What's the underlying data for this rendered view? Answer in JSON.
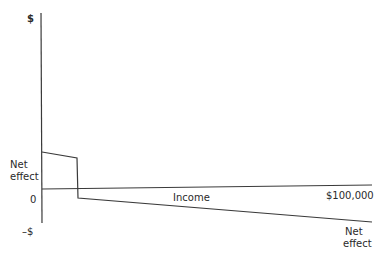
{
  "diagram": {
    "y_axis": {
      "top_label": "$",
      "zero_label": "0",
      "bottom_label": "–$",
      "curve_label": "Net\neffect",
      "curve_label_line1": "Net",
      "curve_label_line2": "effect"
    },
    "x_axis": {
      "label": "Income",
      "end_label": "$100,000"
    },
    "net_effect_curve": {
      "label_line1": "Net",
      "label_line2": "effect",
      "description": "Positive net effect at low income, sharp drop at a threshold, then declining negative net effect as income rises to $100,000"
    },
    "colors": {
      "line": "#3a3a3a",
      "text": "#2a2a2a",
      "background": "#ffffff"
    }
  }
}
